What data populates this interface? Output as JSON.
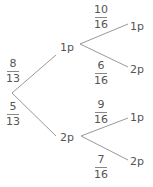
{
  "tree": {
    "level1": [
      {
        "label": "1p",
        "probability": {
          "num": "8",
          "den": "13"
        }
      },
      {
        "label": "2p",
        "probability": {
          "num": "5",
          "den": "13"
        }
      }
    ],
    "level2": [
      {
        "parent": "1p",
        "label": "1p",
        "probability": {
          "num": "10",
          "den": "16"
        }
      },
      {
        "parent": "1p",
        "label": "2p",
        "probability": {
          "num": "6",
          "den": "16"
        }
      },
      {
        "parent": "2p",
        "label": "1p",
        "probability": {
          "num": "9",
          "den": "16"
        }
      },
      {
        "parent": "2p",
        "label": "2p",
        "probability": {
          "num": "7",
          "den": "16"
        }
      }
    ]
  },
  "colors": {
    "line": "#999999",
    "text": "#555555"
  }
}
